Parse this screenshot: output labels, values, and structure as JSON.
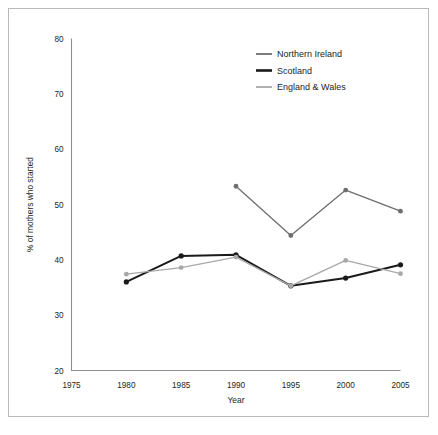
{
  "chart_data": {
    "type": "line",
    "title": "",
    "xlabel": "Year",
    "ylabel": "% of mothers who started",
    "x": [
      1975,
      1980,
      1985,
      1990,
      1995,
      2000,
      2005
    ],
    "xticklabels": [
      "1975",
      "1980",
      "1985",
      "1990",
      "1995",
      "2000",
      "2005"
    ],
    "yticklabels": [
      "20",
      "30",
      "40",
      "50",
      "60",
      "70",
      "80"
    ],
    "yticks": [
      20,
      30,
      40,
      50,
      60,
      70,
      80
    ],
    "xlim": [
      1975,
      2005
    ],
    "ylim": [
      20,
      80
    ],
    "grid": false,
    "legend_position": "top-right",
    "series": [
      {
        "name": "Northern Ireland",
        "color": "#6e6e6e",
        "x": [
          1990,
          1995,
          2000,
          2005
        ],
        "values": [
          53.3,
          44.4,
          52.6,
          48.8
        ]
      },
      {
        "name": "Scotland",
        "color": "#1a1a1a",
        "x": [
          1980,
          1985,
          1990,
          1995,
          2000,
          2005
        ],
        "values": [
          36.0,
          40.7,
          40.9,
          35.3,
          36.7,
          39.1
        ]
      },
      {
        "name": "England & Wales",
        "color": "#a8a8a8",
        "x": [
          1980,
          1985,
          1990,
          1995,
          2000,
          2005
        ],
        "values": [
          37.4,
          38.6,
          40.5,
          35.3,
          39.9,
          37.5
        ]
      }
    ]
  },
  "legend": {
    "items": [
      {
        "label": "Northern Ireland"
      },
      {
        "label": "Scotland"
      },
      {
        "label": "England & Wales"
      }
    ]
  },
  "axes": {
    "y_title": "% of mothers who started",
    "x_title": "Year"
  }
}
